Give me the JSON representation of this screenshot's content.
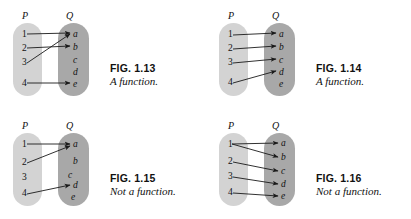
{
  "page": {
    "background_color": "#ffffff",
    "domain_oval_color": "#d3d3d3",
    "codomain_oval_color": "#a8a8a8",
    "arrow_color": "#1a1a1a",
    "text_color": "#111111"
  },
  "figures": [
    {
      "id": "fig-1-13",
      "fig_label": "FIG. 1.13",
      "fig_desc": "A function.",
      "domain": {
        "name": "P",
        "elements": [
          "1",
          "2",
          "3",
          "4"
        ]
      },
      "codomain": {
        "name": "Q",
        "elements": [
          "a",
          "b",
          "c",
          "d",
          "e"
        ]
      },
      "mappings": [
        {
          "from": "1",
          "to": "a"
        },
        {
          "from": "2",
          "to": "b"
        },
        {
          "from": "3",
          "to": "a"
        },
        {
          "from": "4",
          "to": "e"
        }
      ]
    },
    {
      "id": "fig-1-14",
      "fig_label": "FIG. 1.14",
      "fig_desc": "A function.",
      "domain": {
        "name": "P",
        "elements": [
          "1",
          "2",
          "3",
          "4"
        ]
      },
      "codomain": {
        "name": "Q",
        "elements": [
          "a",
          "b",
          "c",
          "d",
          "e"
        ]
      },
      "mappings": [
        {
          "from": "1",
          "to": "a"
        },
        {
          "from": "2",
          "to": "b"
        },
        {
          "from": "3",
          "to": "c"
        },
        {
          "from": "4",
          "to": "d"
        }
      ]
    },
    {
      "id": "fig-1-15",
      "fig_label": "FIG. 1.15",
      "fig_desc": "Not a function.",
      "domain": {
        "name": "P",
        "elements": [
          "1",
          "2",
          "3",
          "4"
        ]
      },
      "codomain": {
        "name": "Q",
        "elements": [
          "a",
          "b",
          "c",
          "d",
          "e"
        ]
      },
      "mappings": [
        {
          "from": "1",
          "to": "a"
        },
        {
          "from": "2",
          "to": "a"
        },
        {
          "from": "4",
          "to": "d"
        }
      ]
    },
    {
      "id": "fig-1-16",
      "fig_label": "FIG. 1.16",
      "fig_desc": "Not a function.",
      "domain": {
        "name": "P",
        "elements": [
          "1",
          "2",
          "3",
          "4"
        ]
      },
      "codomain": {
        "name": "Q",
        "elements": [
          "a",
          "b",
          "c",
          "d",
          "e"
        ]
      },
      "mappings": [
        {
          "from": "1",
          "to": "a"
        },
        {
          "from": "1",
          "to": "b"
        },
        {
          "from": "2",
          "to": "c"
        },
        {
          "from": "3",
          "to": "d"
        },
        {
          "from": "4",
          "to": "e"
        }
      ]
    }
  ]
}
